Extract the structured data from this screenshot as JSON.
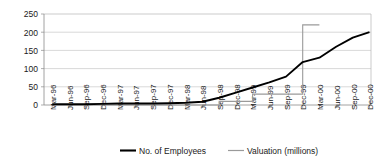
{
  "chart_data": {
    "type": "line",
    "title": "",
    "xlabel": "",
    "ylabel": "",
    "ylim": [
      0,
      250
    ],
    "yticks": [
      0,
      50,
      100,
      150,
      200,
      250
    ],
    "grid": true,
    "legend_position": "bottom",
    "categories": [
      "Mar-96",
      "Jun-96",
      "Sep-96",
      "Dec-96",
      "Mar-97",
      "Jun-97",
      "Sep-97",
      "Dec-97",
      "Mar-98",
      "Jun-98",
      "Sep-98",
      "Dec-98",
      "Mar-99",
      "Jun-99",
      "Sep-99",
      "Dec-99",
      "Mar-00",
      "Jun-00",
      "Sep-00",
      "Dec-00"
    ],
    "series": [
      {
        "name": "No. of Employees",
        "color": "#000000",
        "values": [
          2,
          2,
          2,
          3,
          4,
          4,
          4,
          5,
          6,
          9,
          20,
          34,
          48,
          62,
          78,
          118,
          130,
          160,
          185,
          200
        ],
        "ends_at": "Dec-99"
      },
      {
        "name": "Valuation (millions)",
        "color": "#9a9a9a",
        "values": [
          0,
          0,
          0,
          0,
          0,
          0,
          0,
          0,
          0,
          0,
          10,
          10,
          30,
          30,
          30,
          220,
          220,
          null,
          null,
          null
        ],
        "ends_at": "Dec-99"
      }
    ],
    "legend": [
      {
        "label": "No. of Employees",
        "color": "#000000",
        "line_width": "thick"
      },
      {
        "label": "Valuation (millions)",
        "color": "#9a9a9a",
        "line_width": "thin"
      }
    ]
  },
  "axis": {
    "y_tick_labels": [
      "250",
      "200",
      "150",
      "100",
      "50",
      "0"
    ],
    "x_tick_labels": [
      "Mar-96",
      "Jun-96",
      "Sep-96",
      "Dec-96",
      "Mar-97",
      "Jun-97",
      "Sep-97",
      "Dec-97",
      "Mar-98",
      "Jun-98",
      "Sep-98",
      "Dec-98",
      "Mar-99",
      "Jun-99",
      "Sep-99",
      "Dec-99",
      "Mar-00",
      "Jun-00",
      "Sep-00",
      "Dec-00"
    ]
  },
  "legend": {
    "items": [
      {
        "label": "No. of Employees"
      },
      {
        "label": "Valuation (millions)"
      }
    ]
  },
  "colors": {
    "employees_line": "#000000",
    "valuation_line": "#9a9a9a",
    "grid": "#c9c9c9",
    "axis": "#8c8c8c",
    "text": "#1a1a1a",
    "background": "#ffffff"
  }
}
